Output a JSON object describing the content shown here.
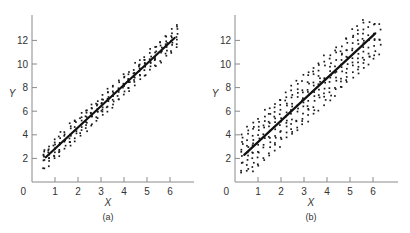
{
  "figure": {
    "colors": {
      "axis": "#8a8a8a",
      "points": "#1a1a1a",
      "line": "#111111",
      "text": "#333333"
    }
  },
  "chart_data": [
    {
      "type": "scatter",
      "panel": "a",
      "caption": "(a)",
      "title": "",
      "xlabel": "X",
      "ylabel": "Y",
      "xlim": [
        0,
        7
      ],
      "ylim": [
        0,
        14
      ],
      "x_ticks": [
        0,
        1,
        2,
        3,
        4,
        5,
        6
      ],
      "y_ticks": [
        2,
        4,
        6,
        8,
        10,
        12
      ],
      "origin_label": "0",
      "grid": false,
      "regression_line": {
        "x": [
          0.6,
          6.2
        ],
        "y": [
          2.1,
          12.2
        ],
        "slope": 1.8,
        "intercept": 1.0
      },
      "scatter": {
        "x_range": [
          0.5,
          6.3
        ],
        "band_half_width": 0.95,
        "approx_points": 260,
        "description": "Tight band of points around the fitted line (small residual variance)"
      }
    },
    {
      "type": "scatter",
      "panel": "b",
      "caption": "(b)",
      "title": "",
      "xlabel": "X",
      "ylabel": "Y",
      "xlim": [
        0,
        7
      ],
      "ylim": [
        0,
        14
      ],
      "x_ticks": [
        0,
        1,
        2,
        3,
        4,
        5,
        6
      ],
      "y_ticks": [
        2,
        4,
        6,
        8,
        10,
        12
      ],
      "origin_label": "0",
      "grid": false,
      "regression_line": {
        "x": [
          0.4,
          6.1
        ],
        "y": [
          2.3,
          12.6
        ],
        "slope": 1.8,
        "intercept": 1.6
      },
      "scatter": {
        "x_range": [
          0.3,
          6.3
        ],
        "band_half_width": 2.2,
        "approx_points": 340,
        "description": "Wide band of points around the fitted line (large residual variance)"
      }
    }
  ],
  "panels": [
    {
      "caption": "(a)",
      "xlabel": "X",
      "ylabel": "Y",
      "origin": "0",
      "xticks": [
        "1",
        "2",
        "3",
        "4",
        "5",
        "6"
      ],
      "yticks": [
        "2",
        "4",
        "6",
        "8",
        "10",
        "12"
      ]
    },
    {
      "caption": "(b)",
      "xlabel": "X",
      "ylabel": "Y",
      "origin": "0",
      "xticks": [
        "1",
        "2",
        "3",
        "4",
        "5",
        "6"
      ],
      "yticks": [
        "2",
        "4",
        "6",
        "8",
        "10",
        "12"
      ]
    }
  ]
}
